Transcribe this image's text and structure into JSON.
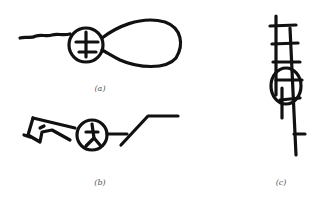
{
  "figure": {
    "panels": [
      {
        "id": "a",
        "label": "(a)"
      },
      {
        "id": "b",
        "label": "(b)"
      },
      {
        "id": "c",
        "label": "(c)"
      }
    ],
    "colors": {
      "ink": "#111111",
      "label": "#555555",
      "background": "#ffffff"
    }
  }
}
